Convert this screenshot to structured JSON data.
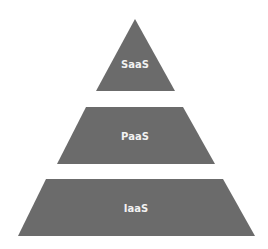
{
  "diagram": {
    "type": "pyramid",
    "fill_color": "#6b6b6b",
    "text_color": "#f2f2f2",
    "layers": [
      {
        "label": "SaaS",
        "position": "top"
      },
      {
        "label": "PaaS",
        "position": "middle"
      },
      {
        "label": "IaaS",
        "position": "bottom"
      }
    ]
  }
}
